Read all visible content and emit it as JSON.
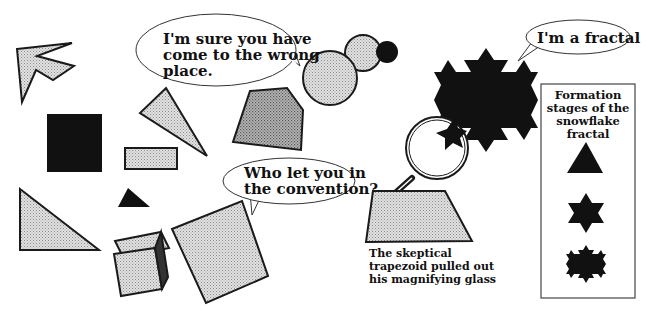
{
  "colors": {
    "background": "#ffffff",
    "outline": "#1a1a1a",
    "light_fill": "#d4d4d4",
    "mid_fill": "#a8a8a8",
    "dark_fill": "#111111"
  },
  "bubbles": {
    "wrong_place": {
      "lines": [
        "I'm sure you have",
        "come to the wrong",
        "place."
      ]
    },
    "convention": {
      "lines": [
        "Who let you in",
        "the convention?"
      ]
    },
    "fractal": {
      "lines": [
        "I'm a fractal"
      ]
    }
  },
  "caption": {
    "lines": [
      "The skeptical",
      "trapezoid pulled out",
      "his magnifying glass"
    ]
  },
  "legend": {
    "title_lines": [
      "Formation",
      "stages of the",
      "snowflake",
      "fractal"
    ],
    "stages": [
      "triangle",
      "hexagram",
      "koch-iteration-2"
    ]
  },
  "shapes": [
    "arrow",
    "black-square",
    "thin-triangle",
    "small-rectangle",
    "small-black-triangle",
    "right-triangle",
    "cube",
    "large-square",
    "pentagon",
    "large-circle",
    "medium-circle",
    "small-black-circle",
    "koch-snowflake",
    "magnifying-glass",
    "trapezoid"
  ]
}
